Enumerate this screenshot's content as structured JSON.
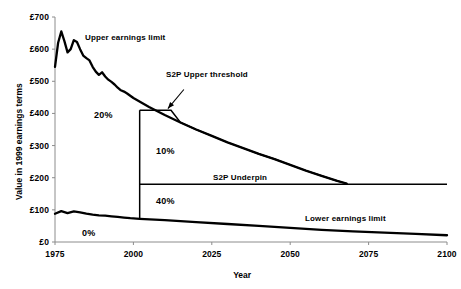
{
  "chart_data": {
    "type": "line",
    "title": "",
    "xlabel": "Year",
    "ylabel": "Value in 1999 earnings terms",
    "xlim": [
      1975,
      2100
    ],
    "ylim": [
      0,
      700
    ],
    "grid": false,
    "legend_position": "inline-annotations",
    "currency_prefix": "£",
    "x_ticks": [
      "1975",
      "2000",
      "2025",
      "2050",
      "2075",
      "2100"
    ],
    "x_tick_values": [
      1975,
      2000,
      2025,
      2050,
      2075,
      2100
    ],
    "y_ticks": [
      "£0",
      "£100",
      "£200",
      "£300",
      "£400",
      "£500",
      "£600",
      "£700"
    ],
    "y_tick_values": [
      0,
      100,
      200,
      300,
      400,
      500,
      600,
      700
    ],
    "series": [
      {
        "name": "Upper earnings limit",
        "label": "Upper earnings limit",
        "x": [
          1975,
          1976,
          1977,
          1978,
          1979,
          1980,
          1981,
          1982,
          1983,
          1984,
          1985,
          1986,
          1987,
          1988,
          1989,
          1990,
          1991,
          1992,
          1993,
          1994,
          1995,
          1996,
          1997,
          1998,
          1999,
          2000,
          2005,
          2010,
          2015,
          2020,
          2025,
          2030,
          2035,
          2040,
          2045,
          2050,
          2055,
          2060,
          2065,
          2068
        ],
        "values": [
          545,
          620,
          655,
          625,
          590,
          600,
          628,
          622,
          600,
          580,
          572,
          565,
          545,
          530,
          520,
          528,
          515,
          505,
          498,
          490,
          480,
          472,
          468,
          462,
          455,
          448,
          420,
          395,
          372,
          350,
          330,
          310,
          292,
          274,
          258,
          240,
          222,
          206,
          190,
          182
        ]
      },
      {
        "name": "S2P Upper threshold",
        "label": "S2P Upper threshold",
        "x": [
          2002,
          2012
        ],
        "values": [
          410,
          410
        ],
        "note": "flat at £410 from 2002 until it meets the falling upper earnings limit around 2012, thereafter follows that curve down to the underpin"
      },
      {
        "name": "S2P Underpin",
        "label": "S2P Underpin",
        "x": [
          2002,
          2100
        ],
        "values": [
          180,
          180
        ]
      },
      {
        "name": "Lower earnings limit",
        "label": "Lower earnings limit",
        "x": [
          1975,
          1977,
          1979,
          1981,
          1983,
          1985,
          1987,
          1989,
          1991,
          1993,
          1995,
          1997,
          1999,
          2002,
          2010,
          2020,
          2030,
          2040,
          2050,
          2060,
          2070,
          2080,
          2090,
          2100
        ],
        "values": [
          88,
          96,
          90,
          95,
          92,
          88,
          85,
          83,
          82,
          80,
          78,
          76,
          74,
          72,
          68,
          62,
          56,
          50,
          44,
          38,
          33,
          29,
          25,
          21
        ]
      }
    ],
    "vertical_divider": {
      "x": 2002,
      "y_from": 72,
      "y_to": 410
    },
    "annotations": [
      {
        "id": "upper-earnings-limit-label",
        "text": "Upper earnings limit",
        "x": 1987,
        "y": 620
      },
      {
        "id": "s2p-upper-threshold-label",
        "text": "S2P Upper threshold",
        "x": 2018,
        "y": 490,
        "arrow_to": {
          "x": 2011,
          "y": 415
        }
      },
      {
        "id": "s2p-underpin-label",
        "text": "S2P Underpin",
        "x": 2043,
        "y": 198
      },
      {
        "id": "lower-earnings-limit-label",
        "text": "Lower earnings limit",
        "x": 2065,
        "y": 78
      }
    ],
    "band_labels": [
      {
        "id": "band-20",
        "text": "20%",
        "x": 1990,
        "y": 400
      },
      {
        "id": "band-10",
        "text": "10%",
        "x": 2012,
        "y": 295
      },
      {
        "id": "band-40",
        "text": "40%",
        "x": 2012,
        "y": 140
      },
      {
        "id": "band-0",
        "text": "0%",
        "x": 1985,
        "y": 38
      }
    ],
    "colors": {
      "line": "#000000",
      "axis": "#808080",
      "text": "#000000",
      "background": "#ffffff"
    }
  }
}
